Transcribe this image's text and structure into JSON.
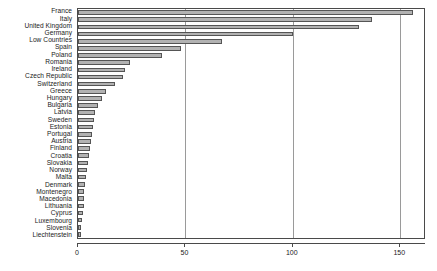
{
  "chart_data": {
    "type": "bar",
    "orientation": "horizontal",
    "title": "",
    "xlabel": "",
    "ylabel": "",
    "xlim": [
      0,
      162
    ],
    "ylim": [
      0,
      31
    ],
    "grid": true,
    "legend": false,
    "xticks": [
      0,
      50,
      100,
      150
    ],
    "xtick_labels": [
      "0",
      "50",
      "100",
      "150"
    ],
    "bar_color": "#b2b2b2",
    "bar_edge_color": "#555555",
    "axis_color": "#4a4a4a",
    "grid_color": "#9a9a9a",
    "categories": [
      "France",
      "Italy",
      "United Kingdom",
      "Germany",
      "Low Countries",
      "Spain",
      "Poland",
      "Romania",
      "Ireland",
      "Czech Republic",
      "Switzerland",
      "Greece",
      "Hungary",
      "Bulgaria",
      "Latvia",
      "Sweden",
      "Estonia",
      "Portugal",
      "Austria",
      "Finland",
      "Croatia",
      "Slovakia",
      "Norway",
      "Malta",
      "Denmark",
      "Montenegro",
      "Macedonia",
      "Lithuania",
      "Cyprus",
      "Luxembourg",
      "Slovenia",
      "Liechtenstein"
    ],
    "values": [
      156,
      137,
      131,
      100,
      67,
      48,
      39,
      24,
      22,
      21,
      17,
      13,
      11,
      9.5,
      8,
      7.5,
      7,
      6.5,
      6,
      5.5,
      5,
      4.5,
      4,
      3.6,
      3.2,
      3,
      2.8,
      2.6,
      2.4,
      2,
      1.6,
      1.2
    ]
  }
}
